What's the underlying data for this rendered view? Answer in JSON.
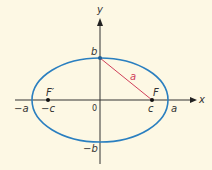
{
  "diagram": {
    "type": "ellipse-foci",
    "colors": {
      "background": "#fdf8e4",
      "ellipse": "#2a7fc0",
      "axes": "#333333",
      "segment": "#d0405a"
    },
    "axes": {
      "x_label": "x",
      "y_label": "y",
      "origin_label": "0"
    },
    "vertices": {
      "left": "−a",
      "right": "a",
      "top": "b",
      "bottom": "−b"
    },
    "foci": {
      "left_name": "F′",
      "left_coord": "−c",
      "right_name": "F",
      "right_coord": "c"
    },
    "segment_label": "a"
  }
}
